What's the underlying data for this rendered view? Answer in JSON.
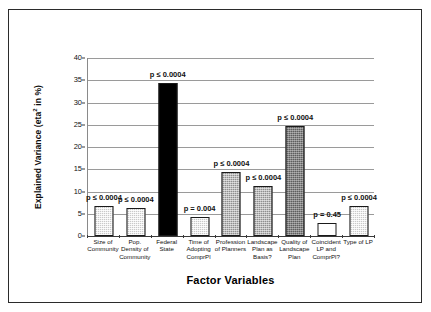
{
  "chart_data": {
    "type": "bar",
    "title": "",
    "xlabel": "Factor Variables",
    "ylabel": "Explained Variance (eta² in %)",
    "ylabel_main": "Explained Variance (eta",
    "ylabel_sup": "2",
    "ylabel_tail": " in %)",
    "ylim": [
      0,
      40
    ],
    "ytick_values": [
      "0",
      "5",
      "10",
      "15",
      "20",
      "25",
      "30",
      "35",
      "40"
    ],
    "grid": "horizontal",
    "legend": "none",
    "categories": [
      "Size of\nCommunity",
      "Pop.\nDensity of\nCommunity",
      "Federal\nState",
      "Time of\nAdopting\nComprPl",
      "Profession\nof Planners",
      "Landscape\nPlan as\nBasis?",
      "Quality of\nLandscape\nPlan",
      "Coincident\nLP and\nComprPl?",
      "Type of LP"
    ],
    "values": [
      6.7,
      6.4,
      34.3,
      4.2,
      14.3,
      11.2,
      24.8,
      3.0,
      6.8
    ],
    "annotations": [
      "p ≤ 0.0004",
      "p ≤ 0.0004",
      "p ≤ 0.0004",
      "p = 0.004",
      "p ≤ 0.0004",
      "p ≤ 0.0004",
      "p ≤ 0.0004",
      "p = 0.45",
      "p ≤ 0.0004"
    ],
    "bar_fills": [
      "light-stipple",
      "light-stipple",
      "solid-black",
      "light-stipple",
      "mid-stipple",
      "mid-stipple",
      "dark-stipple",
      "white",
      "light-stipple"
    ],
    "colors": {
      "light_stipple": "#c9c9c9",
      "mid_stipple": "#8f8f8f",
      "dark_stipple": "#5e5e5e",
      "solid_black": "#000000",
      "white": "#ffffff",
      "gridline": "#9a9a9a",
      "axis": "#3a3a3a",
      "text": "#111111",
      "frame_border": "#2b2b2b"
    }
  }
}
